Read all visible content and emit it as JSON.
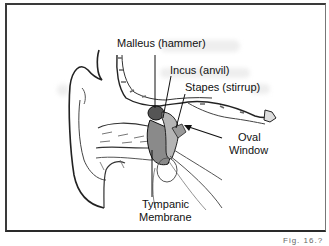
{
  "diagram": {
    "labels": {
      "malleus": "Malleus (hammer)",
      "incus": "Incus (anvil)",
      "stapes": "Stapes (stirrup)",
      "oval_window_line1": "Oval",
      "oval_window_line2": "Window",
      "tympanic_line1": "Tympanic",
      "tympanic_line2": "Membrane"
    },
    "figure_caption": "Fig. 16.?"
  }
}
